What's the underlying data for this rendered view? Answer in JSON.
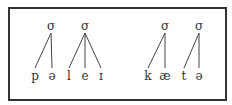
{
  "diagram": {
    "type": "syllable-structure",
    "words": [
      {
        "syllables": [
          {
            "label": "σ",
            "segments": [
              "p",
              "ə"
            ]
          },
          {
            "label": "σ",
            "segments": [
              "l",
              "e",
              "ɪ"
            ]
          }
        ]
      },
      {
        "syllables": [
          {
            "label": "σ",
            "segments": [
              "k",
              "æ"
            ]
          },
          {
            "label": "σ",
            "segments": [
              "t",
              "ə"
            ]
          }
        ]
      }
    ]
  },
  "labels": {
    "s1": "σ",
    "s2": "σ",
    "s3": "σ",
    "s4": "σ",
    "p": "p",
    "schwa1": "ə",
    "l": "l",
    "e": "e",
    "i": "ɪ",
    "k": "k",
    "ae": "æ",
    "t": "t",
    "schwa2": "ə"
  }
}
